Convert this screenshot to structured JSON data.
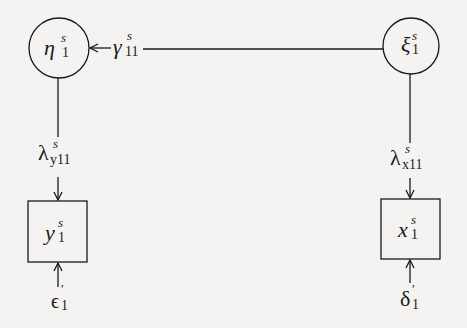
{
  "diagram": {
    "type": "path-diagram",
    "colors": {
      "background": "#f4f3f1",
      "ink": "#1a1a1a"
    },
    "nodes": {
      "eta": {
        "shape": "circle",
        "symbol": "η",
        "superscript": "s",
        "subscript": "1"
      },
      "xi": {
        "shape": "circle",
        "symbol": "ξ",
        "superscript": "s",
        "subscript": "1"
      },
      "y": {
        "shape": "box",
        "symbol": "y",
        "superscript": "s",
        "subscript": "1"
      },
      "x": {
        "shape": "box",
        "symbol": "x",
        "superscript": "s",
        "subscript": "1"
      }
    },
    "paths": {
      "gamma": {
        "symbol": "γ",
        "superscript": "s",
        "subscript": "11",
        "from": "ξ",
        "to": "η"
      },
      "lambda_y": {
        "symbol": "λ",
        "superscript": "s",
        "subscript": "y11",
        "from": "η",
        "to": "y"
      },
      "lambda_x": {
        "symbol": "λ",
        "superscript": "s",
        "subscript": "x11",
        "from": "ξ",
        "to": "x"
      }
    },
    "errors": {
      "epsilon": {
        "symbol": "ϵ",
        "prime": "′",
        "subscript": "1",
        "to": "y"
      },
      "delta": {
        "symbol": "δ",
        "prime": "′",
        "subscript": "1",
        "to": "x"
      }
    }
  }
}
